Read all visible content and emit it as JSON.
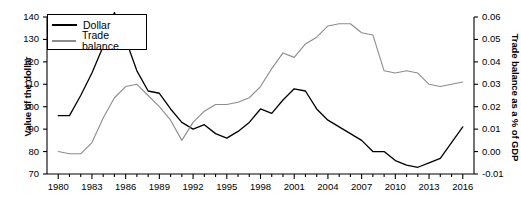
{
  "chart_data": {
    "type": "line",
    "title": "",
    "xlabel": "",
    "ylabel": "Value of the dollar",
    "y2label": "Trade balance as a % of GDP",
    "grid": false,
    "legend_position": "top-left",
    "xlim": [
      1979,
      2017
    ],
    "ylim": [
      70,
      140
    ],
    "y2lim": [
      -0.01,
      0.06
    ],
    "x_tick_labels": [
      "1980",
      "1983",
      "1986",
      "1989",
      "1992",
      "1995",
      "1998",
      "2001",
      "2004",
      "2007",
      "2010",
      "2013",
      "2016"
    ],
    "x_tick_values": [
      1980,
      1983,
      1986,
      1989,
      1992,
      1995,
      1998,
      2001,
      2004,
      2007,
      2010,
      2013,
      2016
    ],
    "x_minor_ticks_every": 1,
    "y_tick_labels": [
      "70",
      "80",
      "90",
      "100",
      "110",
      "120",
      "130",
      "140"
    ],
    "y_tick_values": [
      70,
      80,
      90,
      100,
      110,
      120,
      130,
      140
    ],
    "y2_tick_labels": [
      "-0.01",
      "0.00",
      "0.01",
      "0.02",
      "0.03",
      "0.04",
      "0.05",
      "0.06"
    ],
    "y2_tick_values": [
      -0.01,
      0.0,
      0.01,
      0.02,
      0.03,
      0.04,
      0.05,
      0.06
    ],
    "x": [
      1980,
      1981,
      1982,
      1983,
      1984,
      1985,
      1986,
      1987,
      1988,
      1989,
      1990,
      1991,
      1992,
      1993,
      1994,
      1995,
      1996,
      1997,
      1998,
      1999,
      2000,
      2001,
      2002,
      2003,
      2004,
      2005,
      2006,
      2007,
      2008,
      2009,
      2010,
      2011,
      2012,
      2013,
      2014,
      2015,
      2016
    ],
    "series": [
      {
        "name": "Dollar",
        "axis": "left",
        "color": "#000000",
        "values": [
          96,
          96,
          105,
          115,
          127,
          142,
          130,
          116,
          107,
          106,
          99,
          93,
          90,
          92,
          88,
          86,
          89,
          93,
          99,
          97,
          103,
          108,
          107,
          99,
          94,
          91,
          88,
          85,
          80,
          80,
          76,
          74,
          73,
          75,
          77,
          84,
          91
        ]
      },
      {
        "name": "Trade balance",
        "axis": "right",
        "color": "#8c8c8c",
        "values": [
          0.0,
          -0.001,
          -0.001,
          0.004,
          0.015,
          0.024,
          0.029,
          0.03,
          0.025,
          0.02,
          0.014,
          0.005,
          0.013,
          0.018,
          0.021,
          0.021,
          0.022,
          0.024,
          0.029,
          0.037,
          0.044,
          0.042,
          0.048,
          0.051,
          0.056,
          0.057,
          0.057,
          0.053,
          0.052,
          0.036,
          0.035,
          0.036,
          0.035,
          0.03,
          0.029,
          0.03,
          0.031
        ]
      }
    ]
  },
  "legend": {
    "items": [
      {
        "label": "Dollar",
        "color": "#000000"
      },
      {
        "label": "Trade balance",
        "color": "#8c8c8c"
      }
    ]
  }
}
